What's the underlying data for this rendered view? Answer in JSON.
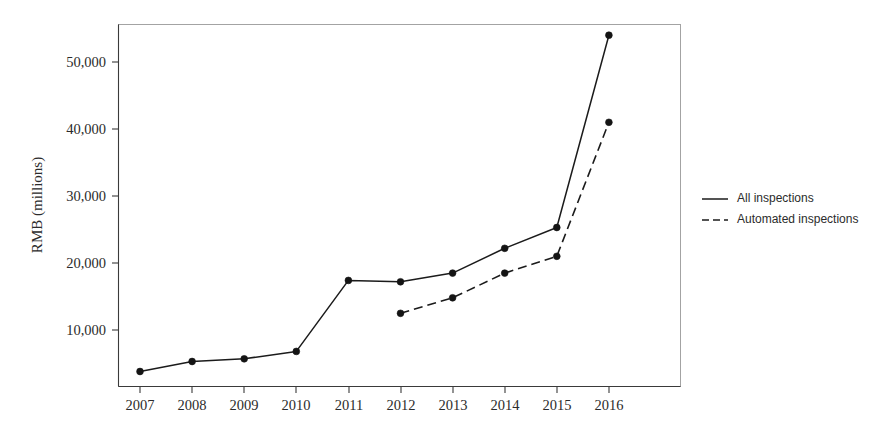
{
  "chart_data": {
    "type": "line",
    "title": "",
    "xlabel": "",
    "ylabel": "RMB (millions)",
    "categories": [
      "2007",
      "2008",
      "2009",
      "2010",
      "2011",
      "2012",
      "2013",
      "2014",
      "2015",
      "2016"
    ],
    "x": [
      2007,
      2008,
      2009,
      2010,
      2011,
      2012,
      2013,
      2014,
      2015,
      2016
    ],
    "series": [
      {
        "name": "All inspections",
        "style": "solid",
        "marker": "filled-circle",
        "color": "#1b1b1b",
        "values": [
          3800,
          5300,
          5700,
          6800,
          17400,
          17200,
          18500,
          22200,
          25300,
          54000
        ]
      },
      {
        "name": "Automated inspections",
        "style": "dashed",
        "marker": "filled-circle",
        "color": "#1b1b1b",
        "values": [
          null,
          null,
          null,
          null,
          null,
          12500,
          14800,
          18500,
          21000,
          41000
        ]
      }
    ],
    "ylim": [
      0,
      57000
    ],
    "xlim": [
      2006.6,
      2016.85
    ],
    "yticks": [
      10000,
      20000,
      30000,
      40000,
      50000
    ],
    "ytick_labels": [
      "10,000",
      "20,000",
      "30,000",
      "40,000",
      "50,000"
    ],
    "xtick_labels": [
      "2007",
      "2008",
      "2009",
      "2010",
      "2011",
      "2012",
      "2013",
      "2014",
      "2015",
      "2016"
    ],
    "grid": false,
    "legend_position": "right",
    "legend": [
      {
        "label": "All inspections",
        "style": "solid"
      },
      {
        "label": "Automated inspections",
        "style": "dashed"
      }
    ]
  },
  "axes": {
    "y_title": "RMB (millions)"
  },
  "legend": {
    "entry_0_label": "All inspections",
    "entry_1_label": "Automated inspections"
  },
  "ytick": {
    "t0": "10,000",
    "t1": "20,000",
    "t2": "30,000",
    "t3": "40,000",
    "t4": "50,000"
  },
  "xtick": {
    "t0": "2007",
    "t1": "2008",
    "t2": "2009",
    "t3": "2010",
    "t4": "2011",
    "t5": "2012",
    "t6": "2013",
    "t7": "2014",
    "t8": "2015",
    "t9": "2016"
  }
}
